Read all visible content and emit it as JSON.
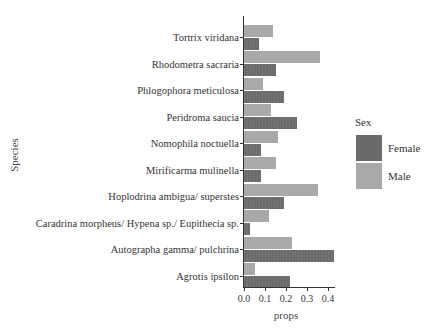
{
  "chart_data": {
    "type": "bar",
    "orientation": "horizontal",
    "title": "",
    "xlabel": "props",
    "ylabel": "Species",
    "xlim": [
      0,
      0.45
    ],
    "xticks": [
      "0.0",
      "0.1",
      "0.2",
      "0.3",
      "0.4"
    ],
    "grid": false,
    "legend_position": "right",
    "legend_title": "Sex",
    "categories": [
      "Tortrix viridana",
      "Rhodometra sacraria",
      "Phlogophora meticulosa",
      "Peridroma saucia",
      "Nomophila noctuella",
      "Mirificarma mulinella",
      "Hoplodrina ambigua/ superstes",
      "Caradrina morpheus/ Hypena sp./ Eupithecia sp.",
      "Autographa gamma/ pulchrina",
      "Agrotis ipsilon"
    ],
    "series": [
      {
        "name": "Female",
        "color": "#6b6b6b",
        "values": [
          0.07,
          0.15,
          0.19,
          0.25,
          0.08,
          0.08,
          0.19,
          0.03,
          0.43,
          0.22
        ]
      },
      {
        "name": "Male",
        "color": "#a9a9a9",
        "values": [
          0.14,
          0.36,
          0.09,
          0.13,
          0.16,
          0.15,
          0.35,
          0.12,
          0.23,
          0.05
        ]
      }
    ]
  }
}
